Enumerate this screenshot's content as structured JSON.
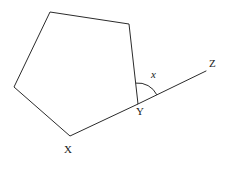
{
  "figure": {
    "background_color": "#ffffff",
    "stroke_color": "#2b2b2b",
    "stroke_width": 1,
    "width": 232,
    "height": 170
  },
  "labels": {
    "vertex_x": "X",
    "vertex_y": "Y",
    "ray_end_z": "Z",
    "angle": "x"
  },
  "shape": {
    "type": "pentagon",
    "closed": true,
    "vertices": [
      {
        "name": "top-left",
        "x": 50,
        "y": 12
      },
      {
        "name": "top-right",
        "x": 129,
        "y": 24
      },
      {
        "name": "Y",
        "x": 138,
        "y": 104
      },
      {
        "name": "X",
        "x": 70,
        "y": 136
      },
      {
        "name": "left",
        "x": 14,
        "y": 87
      }
    ],
    "points_attribute": "50,12 129,24 138,104 70,136 14,87"
  },
  "ray": {
    "name": "ray-YZ",
    "from": {
      "x": 138,
      "y": 104
    },
    "to": {
      "x": 206,
      "y": 71
    }
  },
  "angle_arc": {
    "name": "exterior-angle-arc",
    "center": {
      "x": 138,
      "y": 104
    },
    "radius": 21,
    "path": "M 135.7 83.1 A 21 21 0 0 1 156.8 94.8"
  }
}
